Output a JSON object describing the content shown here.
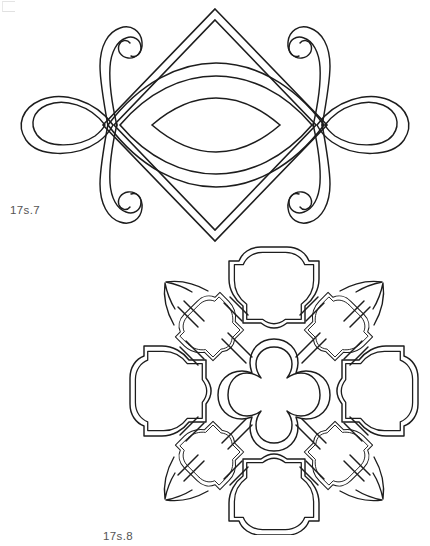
{
  "page": {
    "background_color": "#ffffff",
    "ink_color": "#1d1d1d",
    "caption_color": "#545454",
    "width": 430,
    "height": 546
  },
  "corner_mark": {
    "name": "crop-mark",
    "visible": true,
    "color": "#e0e0e0"
  },
  "figures": [
    {
      "id": "17s.7",
      "caption": "17s.7",
      "name": "ornament-diamond-with-scrolls",
      "description": "Double-outlined diamond (lozenge) with a triple nested vesica/leaf shape across its horizontal axis, flanked left and right by double-outlined teardrop loops and four curling spiral tendrils",
      "elements": [
        "double-outline-diamond",
        "nested-vesica-outer",
        "nested-vesica-middle",
        "nested-vesica-inner",
        "left-teardrop-loop",
        "right-teardrop-loop",
        "upper-left-spiral",
        "upper-right-spiral",
        "lower-left-spiral",
        "lower-right-spiral"
      ]
    },
    {
      "id": "17s.8",
      "caption": "17s.8",
      "name": "ornament-quatrefoil-lattice",
      "description": "Diagonal lattice of double-outlined Moorish quatrefoil / octofoil panels: one central quatrefoil, four large cusped panels at north, south, east and west, four smaller cusped panels on the diagonals, joined by double-lined straight bars, with small tapering tendrils at the outer corners",
      "elements": [
        "center-quatrefoil",
        "north-panel",
        "south-panel",
        "east-panel",
        "west-panel",
        "northwest-small-panel",
        "northeast-small-panel",
        "southwest-small-panel",
        "southeast-small-panel",
        "connector-bars",
        "corner-tendrils"
      ]
    }
  ]
}
